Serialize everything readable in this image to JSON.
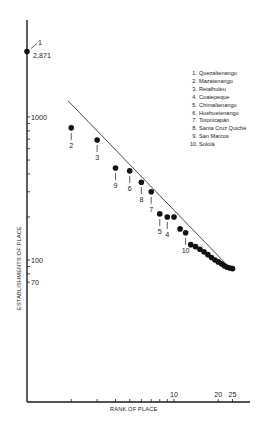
{
  "chart_data": {
    "type": "scatter",
    "title": "",
    "xlabel": "RANK OF PLACE",
    "ylabel": "ESTABLISHMENTS OF PLACE",
    "xscale": "log",
    "yscale": "log",
    "x_tick_labels": [
      "10",
      "20",
      "25"
    ],
    "x_ticks": [
      2,
      3,
      4,
      5,
      6,
      7,
      8,
      9,
      10,
      20,
      25
    ],
    "y_tick_labels": [
      "1000",
      "100",
      "70"
    ],
    "y_ticks": [
      1000,
      900,
      800,
      700,
      600,
      500,
      400,
      300,
      200,
      100,
      90,
      80,
      70
    ],
    "xlim": [
      1,
      30
    ],
    "ylim": [
      40,
      3500
    ],
    "grid": false,
    "reference_line": {
      "description": "rank-size rule line",
      "from": {
        "x": 1.9,
        "y": 1300
      },
      "to": {
        "x": 24,
        "y": 88
      }
    },
    "series": [
      {
        "name": "Places",
        "points": [
          {
            "rank": 1,
            "value": 2871,
            "label": "1",
            "value_label": "2,871"
          },
          {
            "rank": 2,
            "value": 840,
            "label": "2"
          },
          {
            "rank": 3,
            "value": 690,
            "label": "3"
          },
          {
            "rank": 4,
            "value": 440,
            "label": "9"
          },
          {
            "rank": 5,
            "value": 420,
            "label": "6"
          },
          {
            "rank": 6,
            "value": 350,
            "label": "8"
          },
          {
            "rank": 7,
            "value": 300,
            "label": "7"
          },
          {
            "rank": 8,
            "value": 210,
            "label": "5"
          },
          {
            "rank": 9,
            "value": 200,
            "label": "4"
          },
          {
            "rank": 10,
            "value": 200,
            "label": ""
          },
          {
            "rank": 11,
            "value": 165,
            "label": ""
          },
          {
            "rank": 12,
            "value": 155,
            "label": "10"
          },
          {
            "rank": 13,
            "value": 128,
            "label": ""
          },
          {
            "rank": 14,
            "value": 124,
            "label": ""
          },
          {
            "rank": 15,
            "value": 119,
            "label": ""
          },
          {
            "rank": 16,
            "value": 114,
            "label": ""
          },
          {
            "rank": 17,
            "value": 109,
            "label": ""
          },
          {
            "rank": 18,
            "value": 104,
            "label": ""
          },
          {
            "rank": 19,
            "value": 100,
            "label": ""
          },
          {
            "rank": 20,
            "value": 97,
            "label": ""
          },
          {
            "rank": 21,
            "value": 94,
            "label": ""
          },
          {
            "rank": 22,
            "value": 91,
            "label": ""
          },
          {
            "rank": 23,
            "value": 89,
            "label": ""
          },
          {
            "rank": 24,
            "value": 88,
            "label": ""
          },
          {
            "rank": 25,
            "value": 87,
            "label": ""
          }
        ]
      }
    ],
    "legend": [
      "Quezaltenango",
      "Mazatenango",
      "Retalhuleu",
      "Coatepeque",
      "Chimaltenango",
      "Huehuetenango",
      "Totonicapán",
      "Santa Cruz Quiché",
      "San Marcos",
      "Sololá"
    ],
    "legend_position": "upper right"
  },
  "axes": {
    "xlabel": "RANK OF PLACE",
    "ylabel": "ESTABLISHMENTS OF PLACE"
  },
  "legend": {
    "items": [
      {
        "num": "1.",
        "name": "Quezaltenango"
      },
      {
        "num": "2.",
        "name": "Mazatenango"
      },
      {
        "num": "3.",
        "name": "Retalhuleu"
      },
      {
        "num": "4.",
        "name": "Coatepeque"
      },
      {
        "num": "5.",
        "name": "Chimaltenango"
      },
      {
        "num": "6.",
        "name": "Huehuetenango"
      },
      {
        "num": "7.",
        "name": "Totonicapán"
      },
      {
        "num": "8.",
        "name": "Santa Cruz Quiché"
      },
      {
        "num": "9.",
        "name": "San Marcos"
      },
      {
        "num": "10.",
        "name": "Sololá"
      }
    ]
  }
}
